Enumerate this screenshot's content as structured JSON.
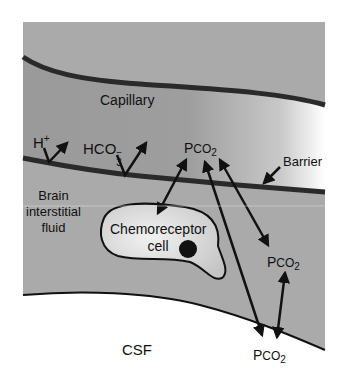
{
  "diagram": {
    "title": "",
    "regions": {
      "capillary": "Capillary",
      "barrier": "Barrier",
      "brain_fluid_line1": "Brain",
      "brain_fluid_line2": "interstitial",
      "brain_fluid_line3": "fluid",
      "cell_line1": "Chemoreceptor",
      "cell_line2": "cell",
      "csf": "CSF"
    },
    "species": {
      "h_base": "H",
      "h_sup": "+",
      "hco3_base": "HCO",
      "hco3_sub": "3",
      "hco3_sup": "−",
      "pco2_p": "P",
      "pco2_co": "CO",
      "pco2_sub": "2"
    },
    "colors": {
      "tissue": "#a9a9a9",
      "capillary_dark": "#8c8c8c",
      "capillary_light": "#ffffff",
      "wall": "#2a2a2a",
      "cell_fill": "#dcdcdc",
      "csf": "#ffffff",
      "ink": "#111111"
    }
  }
}
